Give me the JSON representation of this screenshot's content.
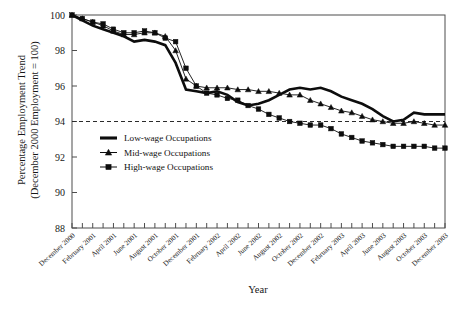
{
  "chart_data": {
    "type": "line",
    "title": "",
    "xlabel": "Year",
    "ylabel": "Percentage Employment Trend (December 2000 Employment = 100)",
    "ylabel_line1": "Percentage Employment Trend",
    "ylabel_line2": "(December 2000 Employment = 100)",
    "ylim": [
      88,
      100
    ],
    "yticks": [
      88,
      90,
      92,
      94,
      96,
      98,
      100
    ],
    "grid": false,
    "legend_position": "center-left",
    "reference_line": {
      "y": 94,
      "style": "dashed"
    },
    "x_tick_interval_months": 2,
    "x": [
      "December 2000",
      "January 2001",
      "February 2001",
      "March 2001",
      "April 2001",
      "May 2001",
      "June 2001",
      "July 2001",
      "August 2001",
      "September 2001",
      "October 2001",
      "November 2001",
      "December 2001",
      "January 2002",
      "February 2002",
      "March 2002",
      "April 2002",
      "May 2002",
      "June 2002",
      "July 2002",
      "August 2002",
      "September 2002",
      "October 2002",
      "November 2002",
      "December 2002",
      "January 2003",
      "February 2003",
      "March 2003",
      "April 2003",
      "May 2003",
      "June 2003",
      "July 2003",
      "August 2003",
      "September 2003",
      "October 2003",
      "November 2003",
      "December 2003"
    ],
    "x_tick_labels": [
      "December 2000",
      "February 2001",
      "April 2001",
      "June 2001",
      "August 2001",
      "October 2001",
      "December 2001",
      "February 2002",
      "April 2002",
      "June 2002",
      "August 2002",
      "October 2002",
      "December 2002",
      "February 2003",
      "April 2003",
      "June 2003",
      "August 2003",
      "October 2003",
      "December 2003"
    ],
    "series": [
      {
        "name": "Low-wage Occupations",
        "marker": "none",
        "line_width": "thick",
        "values": [
          100.0,
          99.7,
          99.4,
          99.2,
          99.0,
          98.8,
          98.5,
          98.6,
          98.5,
          98.3,
          97.3,
          95.8,
          95.7,
          95.6,
          95.7,
          95.5,
          95.1,
          94.9,
          95.0,
          95.2,
          95.5,
          95.8,
          95.9,
          95.8,
          95.9,
          95.7,
          95.4,
          95.2,
          95.0,
          94.7,
          94.3,
          94.0,
          94.1,
          94.5,
          94.4,
          94.4,
          94.4
        ]
      },
      {
        "name": "Mid-wage Occupations",
        "marker": "triangle",
        "line_width": "thin",
        "values": [
          100.0,
          99.8,
          99.6,
          99.4,
          99.1,
          98.9,
          98.9,
          99.0,
          99.0,
          98.8,
          98.0,
          96.4,
          96.0,
          95.9,
          95.9,
          95.9,
          95.8,
          95.8,
          95.7,
          95.7,
          95.6,
          95.5,
          95.5,
          95.2,
          95.0,
          94.8,
          94.6,
          94.5,
          94.3,
          94.1,
          94.0,
          93.9,
          93.9,
          94.0,
          93.9,
          93.8,
          93.8
        ]
      },
      {
        "name": "High-wage Occupations",
        "marker": "square",
        "line_width": "thin",
        "values": [
          100.0,
          99.8,
          99.6,
          99.5,
          99.2,
          99.0,
          99.0,
          99.1,
          99.0,
          98.7,
          98.5,
          97.0,
          96.0,
          95.6,
          95.5,
          95.3,
          95.2,
          94.9,
          94.7,
          94.4,
          94.2,
          94.0,
          93.9,
          93.8,
          93.8,
          93.6,
          93.3,
          93.1,
          92.9,
          92.8,
          92.7,
          92.6,
          92.6,
          92.6,
          92.6,
          92.5,
          92.5
        ]
      }
    ],
    "legend": [
      {
        "label": "Low-wage Occupations",
        "marker": "none"
      },
      {
        "label": "Mid-wage Occupations",
        "marker": "triangle"
      },
      {
        "label": "High-wage Occupations",
        "marker": "square"
      }
    ],
    "colors": {
      "series": "#0d0d0d",
      "frame": "#4d4d4d",
      "text": "#171717",
      "background": "#ffffff"
    }
  }
}
